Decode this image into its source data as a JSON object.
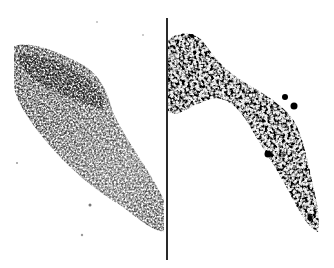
{
  "image": {
    "description": "Two side-by-side grayscale microscopy panels of an elongated diagonal tissue section separated by a vertical line",
    "panels": [
      {
        "id": "left",
        "style": "dense gray stippled texture"
      },
      {
        "id": "right",
        "style": "sparse black blob-like puncta"
      }
    ],
    "colors": {
      "background": "#ffffff",
      "divider": "#2a2a2a",
      "tissue_gray": "#6a6a6a",
      "tissue_dark": "#1a1a1a"
    }
  }
}
